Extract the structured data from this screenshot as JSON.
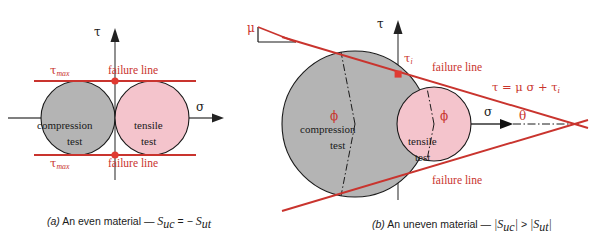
{
  "figure": {
    "colors": {
      "failure_line": "#c9342e",
      "compression_fill": "#b4b4b4",
      "tensile_fill": "#f4c4cc",
      "axis": "#555555",
      "outline": "#1a1a1a"
    }
  },
  "panel_a": {
    "caption_tag": "(a)",
    "caption_text": "An even material —",
    "caption_eq_s1": "S",
    "caption_eq_sub1": "uc",
    "caption_eq_mid": "= −",
    "caption_eq_s2": "S",
    "caption_eq_sub2": "ut",
    "axis_tau": "τ",
    "axis_sigma": "σ",
    "tau_max_top": "τ",
    "tau_max_top_sub": "max",
    "tau_max_bottom": "τ",
    "tau_max_bottom_sub": "max",
    "failure_line_top": "failure line",
    "failure_line_bottom": "failure line",
    "compression_label_1": "compression",
    "compression_label_2": "test",
    "tensile_label_1": "tensile",
    "tensile_label_2": "test"
  },
  "panel_b": {
    "caption_tag": "(b)",
    "caption_text": "An uneven material —",
    "caption_eq_s1": "|S",
    "caption_eq_sub1": "uc",
    "caption_eq_bar1": "|",
    "caption_eq_mid": ">",
    "caption_eq_s2": "|S",
    "caption_eq_sub2": "ut",
    "caption_eq_bar2": "|",
    "axis_tau": "τ",
    "axis_sigma": "σ",
    "mu_label": "μ",
    "tau_i": "τ",
    "tau_i_sub": "i",
    "failure_line_top": "failure line",
    "failure_line_bottom": "failure line",
    "equation": "τ = μ σ + τ",
    "equation_sub": "i",
    "theta_label": "θ",
    "phi_left": "ϕ",
    "phi_right": "ϕ",
    "compression_label_1": "compression",
    "compression_label_2": "test",
    "tensile_label_1": "tensile",
    "tensile_label_2": "test"
  }
}
